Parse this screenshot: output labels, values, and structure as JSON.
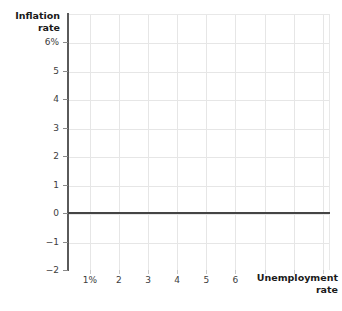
{
  "chart_data": {
    "type": "line",
    "title": "",
    "xlabel": "Unemployment\nrate",
    "ylabel": "Inflation\nrate",
    "x_tick_labels": [
      "1%",
      "2",
      "3",
      "4",
      "5",
      "6"
    ],
    "x_tick_values": [
      1,
      2,
      3,
      4,
      5,
      6
    ],
    "y_tick_labels": [
      "6%",
      "5",
      "4",
      "3",
      "2",
      "1",
      "0",
      "-1",
      "-2"
    ],
    "y_tick_values": [
      6,
      5,
      4,
      3,
      2,
      1,
      0,
      -1,
      -2
    ],
    "xlim": [
      0.25,
      9.25
    ],
    "ylim": [
      -2,
      7
    ],
    "grid": true,
    "legend": "none",
    "series": [],
    "annotations": [
      {
        "name": "zero-axis-line",
        "description": "Horizontal reference line drawn at inflation rate = 0",
        "y": 0,
        "color": "#444444"
      }
    ],
    "colors": {
      "background": "#ffffff",
      "gridline": "#e6e6e6",
      "axis": "#5a5a5a",
      "zero_line": "#444444",
      "tick_label": "#3d3d3d",
      "axis_title": "#1a1a1a"
    }
  }
}
